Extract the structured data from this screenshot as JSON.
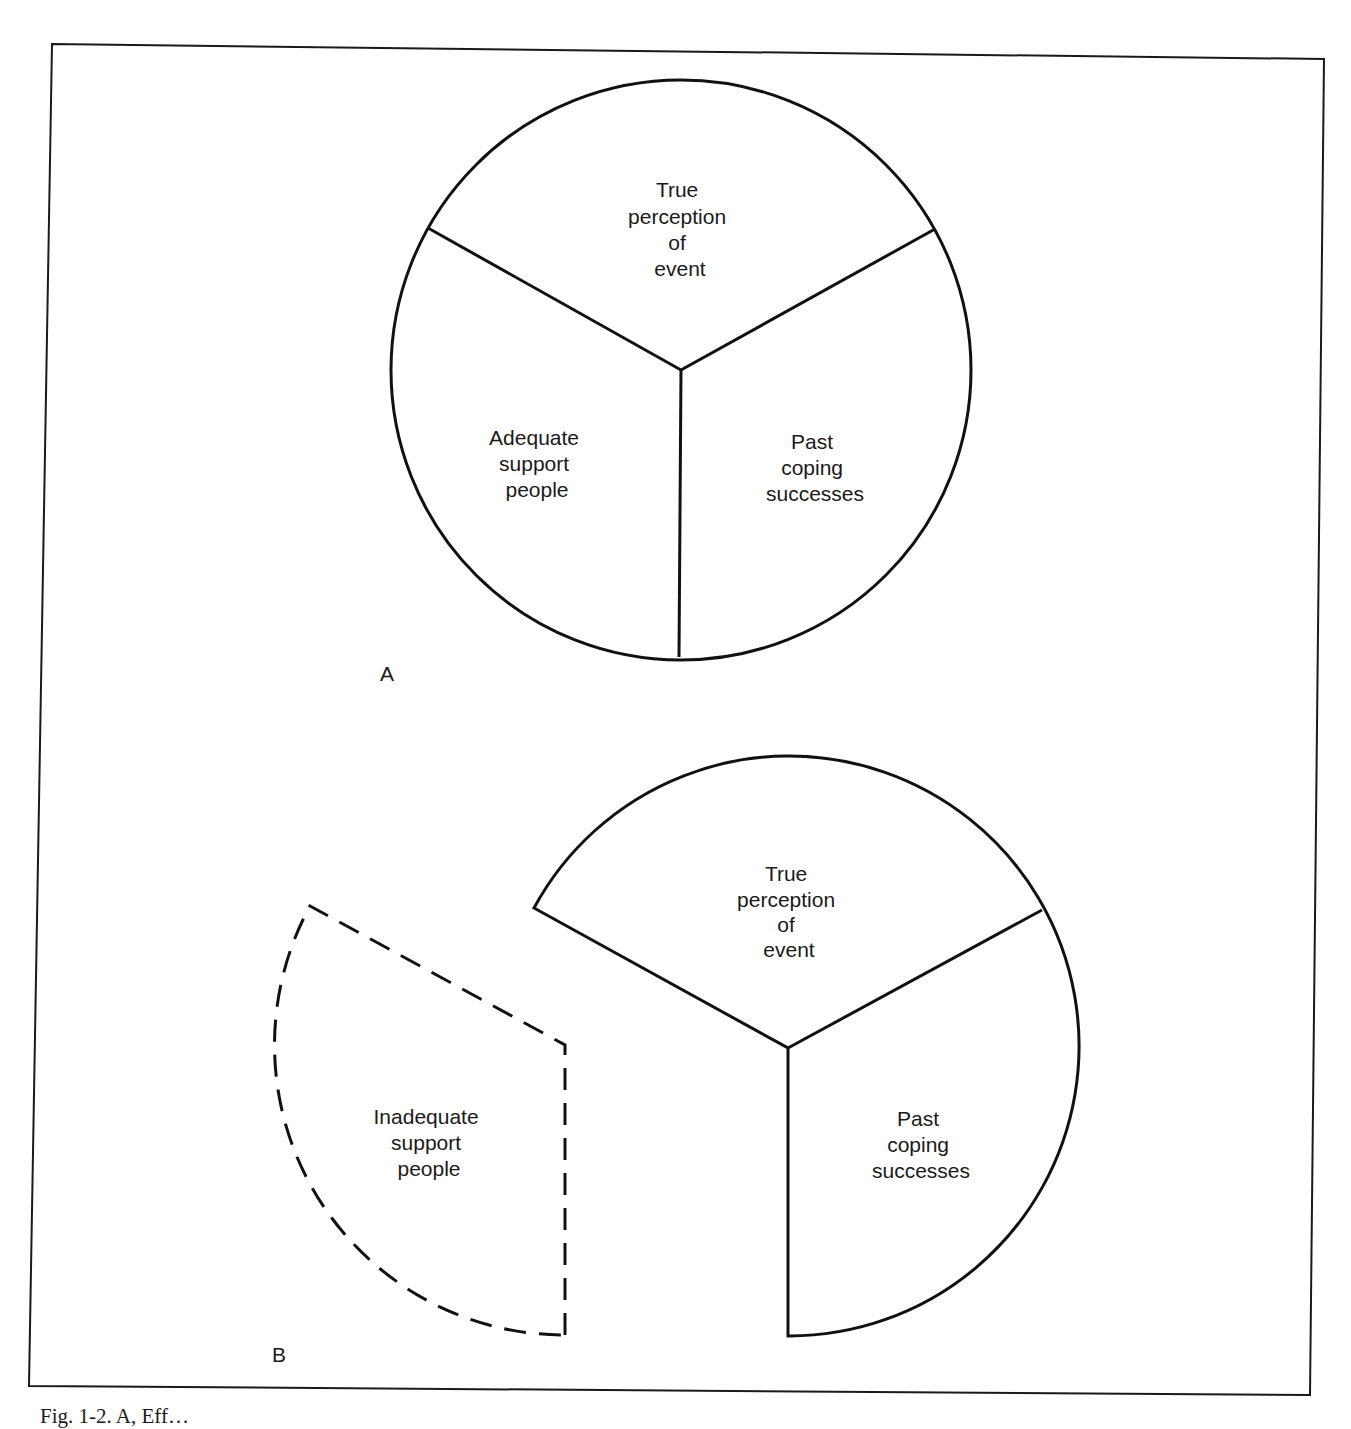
{
  "figure": {
    "panels": [
      {
        "id": "A",
        "label": "A",
        "segments": [
          {
            "lines": [
              "True",
              "perception",
              "of",
              "event"
            ]
          },
          {
            "lines": [
              "Adequate",
              "support",
              "people"
            ]
          },
          {
            "lines": [
              "Past",
              "coping",
              "successes"
            ]
          }
        ]
      },
      {
        "id": "B",
        "label": "B",
        "segments": [
          {
            "lines": [
              "True",
              "perception",
              "of",
              "event"
            ]
          },
          {
            "lines": [
              "Past",
              "coping",
              "successes"
            ]
          }
        ],
        "detached_segment": {
          "lines": [
            "Inadequate",
            "support",
            "people"
          ],
          "style": "dashed"
        }
      }
    ],
    "caption_partial": "Fig. 1-2. A, Eff…"
  }
}
